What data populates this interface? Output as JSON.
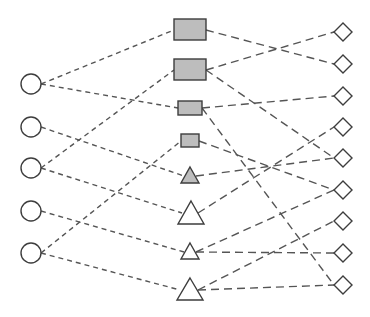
{
  "diagram": {
    "type": "tripartite-graph",
    "colors": {
      "stroke": "#3d3d3d",
      "edge": "#555555",
      "filled": "#bdbdbd",
      "empty": "#ffffff"
    },
    "left_nodes": [
      {
        "id": "C1",
        "shape": "circle",
        "cx": 31,
        "cy": 84,
        "r": 10
      },
      {
        "id": "C2",
        "shape": "circle",
        "cx": 31,
        "cy": 127,
        "r": 10
      },
      {
        "id": "C3",
        "shape": "circle",
        "cx": 31,
        "cy": 168,
        "r": 10
      },
      {
        "id": "C4",
        "shape": "circle",
        "cx": 31,
        "cy": 211,
        "r": 10
      },
      {
        "id": "C5",
        "shape": "circle",
        "cx": 31,
        "cy": 253,
        "r": 10
      }
    ],
    "middle_nodes": [
      {
        "id": "R1",
        "shape": "rect",
        "x": 174,
        "y": 19,
        "w": 32,
        "h": 21,
        "filled": true
      },
      {
        "id": "R2",
        "shape": "rect",
        "x": 174,
        "y": 59,
        "w": 32,
        "h": 21,
        "filled": true
      },
      {
        "id": "R3",
        "shape": "rect",
        "x": 178,
        "y": 101,
        "w": 24,
        "h": 14,
        "filled": true
      },
      {
        "id": "R4",
        "shape": "rect",
        "x": 181,
        "y": 134,
        "w": 18,
        "h": 13,
        "filled": true
      },
      {
        "id": "T1",
        "shape": "triangle",
        "cx": 190,
        "top": 167,
        "base": 183,
        "half": 9,
        "filled": true
      },
      {
        "id": "T2",
        "shape": "triangle",
        "cx": 191,
        "top": 201,
        "base": 224,
        "half": 13,
        "filled": false
      },
      {
        "id": "T3",
        "shape": "triangle",
        "cx": 190,
        "top": 243,
        "base": 259,
        "half": 9,
        "filled": false
      },
      {
        "id": "T4",
        "shape": "triangle",
        "cx": 190,
        "top": 278,
        "base": 300,
        "half": 13,
        "filled": false
      }
    ],
    "right_nodes": [
      {
        "id": "D1",
        "shape": "diamond",
        "cx": 343,
        "cy": 32,
        "r": 9
      },
      {
        "id": "D2",
        "shape": "diamond",
        "cx": 343,
        "cy": 64,
        "r": 9
      },
      {
        "id": "D3",
        "shape": "diamond",
        "cx": 343,
        "cy": 96,
        "r": 9
      },
      {
        "id": "D4",
        "shape": "diamond",
        "cx": 343,
        "cy": 127,
        "r": 9
      },
      {
        "id": "D5",
        "shape": "diamond",
        "cx": 343,
        "cy": 158,
        "r": 9
      },
      {
        "id": "D6",
        "shape": "diamond",
        "cx": 343,
        "cy": 190,
        "r": 9
      },
      {
        "id": "D7",
        "shape": "diamond",
        "cx": 343,
        "cy": 221,
        "r": 9
      },
      {
        "id": "D8",
        "shape": "diamond",
        "cx": 343,
        "cy": 253,
        "r": 9
      },
      {
        "id": "D9",
        "shape": "diamond",
        "cx": 343,
        "cy": 285,
        "r": 9
      }
    ],
    "left_edges": [
      {
        "from": "C1",
        "to": "R1",
        "x1": 41,
        "y1": 84,
        "x2": 174,
        "y2": 30
      },
      {
        "from": "C1",
        "to": "R3",
        "x1": 41,
        "y1": 84,
        "x2": 178,
        "y2": 108
      },
      {
        "from": "C2",
        "to": "T1",
        "x1": 41,
        "y1": 127,
        "x2": 184,
        "y2": 176
      },
      {
        "from": "C3",
        "to": "R2",
        "x1": 41,
        "y1": 168,
        "x2": 174,
        "y2": 70
      },
      {
        "from": "C3",
        "to": "T2",
        "x1": 41,
        "y1": 168,
        "x2": 182,
        "y2": 213
      },
      {
        "from": "C4",
        "to": "T3",
        "x1": 41,
        "y1": 211,
        "x2": 184,
        "y2": 252
      },
      {
        "from": "C5",
        "to": "R4",
        "x1": 41,
        "y1": 253,
        "x2": 181,
        "y2": 141
      },
      {
        "from": "C5",
        "to": "T4",
        "x1": 41,
        "y1": 253,
        "x2": 180,
        "y2": 290
      }
    ],
    "right_edges": [
      {
        "from": "R1",
        "to": "D2",
        "x1": 206,
        "y1": 30,
        "x2": 334,
        "y2": 64
      },
      {
        "from": "R2",
        "to": "D1",
        "x1": 206,
        "y1": 70,
        "x2": 334,
        "y2": 32
      },
      {
        "from": "R2",
        "to": "D5",
        "x1": 206,
        "y1": 70,
        "x2": 334,
        "y2": 158
      },
      {
        "from": "R3",
        "to": "D3",
        "x1": 202,
        "y1": 108,
        "x2": 334,
        "y2": 96
      },
      {
        "from": "R3",
        "to": "D9",
        "x1": 202,
        "y1": 108,
        "x2": 334,
        "y2": 285
      },
      {
        "from": "R4",
        "to": "D6",
        "x1": 199,
        "y1": 141,
        "x2": 334,
        "y2": 190
      },
      {
        "from": "T1",
        "to": "D5",
        "x1": 196,
        "y1": 176,
        "x2": 334,
        "y2": 158
      },
      {
        "from": "T2",
        "to": "D4",
        "x1": 198,
        "y1": 213,
        "x2": 334,
        "y2": 127
      },
      {
        "from": "T3",
        "to": "D6",
        "x1": 196,
        "y1": 252,
        "x2": 334,
        "y2": 190
      },
      {
        "from": "T3",
        "to": "D8",
        "x1": 196,
        "y1": 252,
        "x2": 334,
        "y2": 253
      },
      {
        "from": "T4",
        "to": "D7",
        "x1": 198,
        "y1": 290,
        "x2": 334,
        "y2": 221
      },
      {
        "from": "T4",
        "to": "D9",
        "x1": 198,
        "y1": 290,
        "x2": 334,
        "y2": 285
      }
    ]
  }
}
